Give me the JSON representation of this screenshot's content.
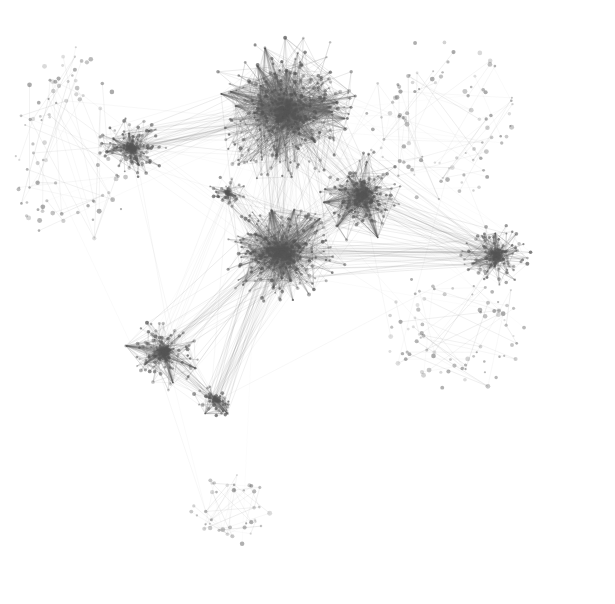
{
  "figure": {
    "type": "network-graph",
    "title": "",
    "caption": "",
    "background_color": "#ffffff",
    "node_color": "#555555",
    "edge_color": "#666666",
    "width": 615,
    "height": 604
  },
  "chart_data": {
    "type": "scatter",
    "title": "",
    "subtitle": "",
    "xlabel": "",
    "ylabel": "",
    "grid": false,
    "legend": "none",
    "xlim": [
      0,
      615
    ],
    "ylim": [
      0,
      604
    ],
    "clusters": [
      {
        "name": "core-top-hairball",
        "cx": 285,
        "cy": 110,
        "rx": 72,
        "ry": 72,
        "nodes": 520,
        "density": 0.97,
        "edges": 2100,
        "hub": true
      },
      {
        "name": "core-central",
        "cx": 282,
        "cy": 252,
        "rx": 62,
        "ry": 48,
        "nodes": 400,
        "density": 0.95,
        "edges": 1700,
        "hub": true
      },
      {
        "name": "right-upper-cluster",
        "cx": 362,
        "cy": 196,
        "rx": 42,
        "ry": 40,
        "nodes": 240,
        "density": 0.88,
        "edges": 900,
        "hub": true
      },
      {
        "name": "left-upper-cluster",
        "cx": 131,
        "cy": 148,
        "rx": 32,
        "ry": 30,
        "nodes": 150,
        "density": 0.8,
        "edges": 520,
        "hub": true
      },
      {
        "name": "lower-left-cluster",
        "cx": 163,
        "cy": 352,
        "rx": 36,
        "ry": 34,
        "nodes": 180,
        "density": 0.82,
        "edges": 620,
        "hub": true
      },
      {
        "name": "lower-left-small",
        "cx": 215,
        "cy": 400,
        "rx": 20,
        "ry": 18,
        "nodes": 70,
        "density": 0.7,
        "edges": 200,
        "hub": true
      },
      {
        "name": "right-far-cluster",
        "cx": 496,
        "cy": 256,
        "rx": 34,
        "ry": 30,
        "nodes": 150,
        "density": 0.8,
        "edges": 500,
        "hub": true
      },
      {
        "name": "upper-mid-small",
        "cx": 228,
        "cy": 192,
        "rx": 18,
        "ry": 16,
        "nodes": 55,
        "density": 0.6,
        "edges": 130,
        "hub": false
      },
      {
        "name": "bottom-sparse-cluster",
        "cx": 232,
        "cy": 508,
        "rx": 40,
        "ry": 36,
        "nodes": 40,
        "density": 0.18,
        "edges": 40,
        "hub": false
      },
      {
        "name": "left-peripheral-arc",
        "cx": 72,
        "cy": 148,
        "rx": 58,
        "ry": 95,
        "nodes": 90,
        "density": 0.1,
        "edges": 45,
        "hub": false
      },
      {
        "name": "right-peripheral-spray",
        "cx": 440,
        "cy": 120,
        "rx": 72,
        "ry": 78,
        "nodes": 95,
        "density": 0.1,
        "edges": 45,
        "hub": false
      },
      {
        "name": "right-lower-spray",
        "cx": 455,
        "cy": 330,
        "rx": 70,
        "ry": 60,
        "nodes": 80,
        "density": 0.1,
        "edges": 35,
        "hub": false
      }
    ],
    "trunk_edges": [
      {
        "from": "core-top-hairball",
        "to": "core-central"
      },
      {
        "from": "core-top-hairball",
        "to": "right-upper-cluster"
      },
      {
        "from": "core-top-hairball",
        "to": "left-upper-cluster"
      },
      {
        "from": "core-central",
        "to": "right-upper-cluster"
      },
      {
        "from": "core-central",
        "to": "lower-left-cluster"
      },
      {
        "from": "core-central",
        "to": "lower-left-small"
      },
      {
        "from": "core-central",
        "to": "right-far-cluster"
      },
      {
        "from": "core-central",
        "to": "upper-mid-small"
      },
      {
        "from": "right-upper-cluster",
        "to": "right-far-cluster"
      },
      {
        "from": "lower-left-cluster",
        "to": "lower-left-small"
      }
    ],
    "totals": {
      "nodes": 2070,
      "edges": 6835,
      "components": 12
    }
  }
}
